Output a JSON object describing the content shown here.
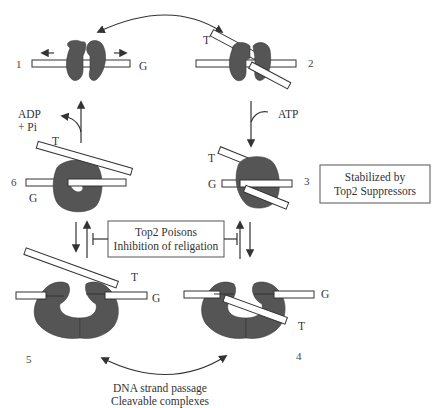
{
  "figure": {
    "steps": [
      {
        "id": "1",
        "label": "1"
      },
      {
        "id": "2",
        "label": "2"
      },
      {
        "id": "3",
        "label": "3"
      },
      {
        "id": "4",
        "label": "4"
      },
      {
        "id": "5",
        "label": "5"
      },
      {
        "id": "6",
        "label": "6"
      }
    ],
    "strand_labels": {
      "g": "G",
      "t": "T"
    },
    "cofactors": {
      "atp": "ATP",
      "adp_line1": "ADP",
      "adp_line2": "+ Pi"
    },
    "boxes": {
      "suppressors": {
        "line1": "Stabilized by",
        "line2": "Top2 Suppressors"
      },
      "poisons": {
        "line1": "Top2 Poisons",
        "line2": "Inhibition of religation"
      }
    },
    "caption": {
      "line1": "DNA strand passage",
      "line2": "Cleavable complexes"
    },
    "colors": {
      "enzyme": "#555555",
      "line": "#333333",
      "background": "#ffffff"
    }
  }
}
